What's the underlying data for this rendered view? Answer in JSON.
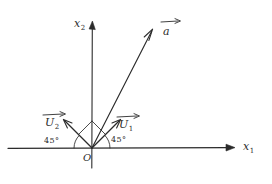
{
  "figure": {
    "background_color": "#ffffff",
    "ink_color": "#2b2b2b",
    "axes": {
      "horizontal": {
        "name": "x1-axis",
        "label_base": "x",
        "label_sub": "1"
      },
      "vertical": {
        "name": "x2-axis",
        "label_base": "x",
        "label_sub": "2"
      }
    },
    "origin": {
      "label": "O"
    },
    "vectors": [
      {
        "id": "a",
        "label_base": "a",
        "label_sub": "",
        "description": "resultant vector"
      },
      {
        "id": "u1",
        "label_base": "U",
        "label_sub": "1",
        "description": "basis vector at 45 degrees right of vertical"
      },
      {
        "id": "u2",
        "label_base": "U",
        "label_sub": "2",
        "description": "basis vector at 45 degrees left of vertical"
      }
    ],
    "angles": [
      {
        "id": "left-angle",
        "value": "45°"
      },
      {
        "id": "right-angle",
        "value": "45°"
      }
    ]
  }
}
